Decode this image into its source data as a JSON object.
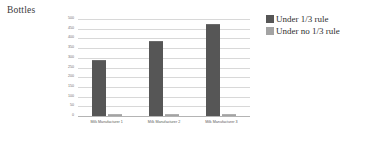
{
  "chart_data": {
    "type": "bar",
    "title": "Bottles",
    "xlabel": "",
    "ylabel": "",
    "ylim": [
      0,
      500
    ],
    "ytick_step": 50,
    "yticks": [
      "0",
      "50",
      "100",
      "150",
      "200",
      "250",
      "300",
      "350",
      "400",
      "450",
      "500"
    ],
    "grid": true,
    "legend_position": "right",
    "categories": [
      "Milk Manufacturer 1",
      "Milk Manufacturer 2",
      "Milk Manufacturer 3"
    ],
    "series": [
      {
        "name": "Under 1/3 rule",
        "color": "#565656",
        "values": [
          285,
          380,
          470
        ]
      },
      {
        "name": "Under no 1/3 rule",
        "color": "#a3a3a3",
        "values": [
          4,
          3,
          3
        ]
      }
    ]
  },
  "colors": {
    "series_a": "#565656",
    "series_b": "#a3a3a3",
    "gridline": "#d8d8d8",
    "axis": "#b4b4b4",
    "background": "#ffffff"
  }
}
